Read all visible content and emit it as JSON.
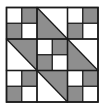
{
  "figure": {
    "grid_size": 6,
    "origin": {
      "x": 6.5,
      "y": 7.5
    },
    "cell_w": 15.25,
    "cell_h": 15.75,
    "colors": {
      "background": "#ffffff",
      "dark_fill": "#8e8e8e",
      "light_fill": "#ffffff",
      "line": "#1a1a1a"
    },
    "line_width": 1.3,
    "four_patches": [
      {
        "name": "four-patch-top-left",
        "col": 0,
        "row": 0,
        "cells": [
          "light",
          "dark",
          "dark",
          "light"
        ]
      },
      {
        "name": "four-patch-top-right",
        "col": 4,
        "row": 0,
        "cells": [
          "light",
          "dark",
          "dark",
          "light"
        ]
      },
      {
        "name": "four-patch-center",
        "col": 2,
        "row": 2,
        "cells": [
          "light",
          "dark",
          "dark",
          "light"
        ]
      },
      {
        "name": "four-patch-bottom-left",
        "col": 0,
        "row": 4,
        "cells": [
          "light",
          "dark",
          "dark",
          "light"
        ]
      },
      {
        "name": "four-patch-bottom-right",
        "col": 4,
        "row": 4,
        "cells": [
          "light",
          "dark",
          "dark",
          "light"
        ]
      }
    ],
    "half_square_triangles": [
      {
        "name": "hst-top-center",
        "col": 2,
        "row": 0,
        "diagonal": "tl-br",
        "dark_half": "lower-left"
      },
      {
        "name": "hst-middle-left",
        "col": 0,
        "row": 2,
        "diagonal": "tl-br",
        "dark_half": "upper-right"
      },
      {
        "name": "hst-middle-right",
        "col": 4,
        "row": 2,
        "diagonal": "tl-br",
        "dark_half": "lower-left"
      },
      {
        "name": "hst-bottom-center",
        "col": 2,
        "row": 4,
        "diagonal": "tl-br",
        "dark_half": "upper-right"
      }
    ]
  }
}
